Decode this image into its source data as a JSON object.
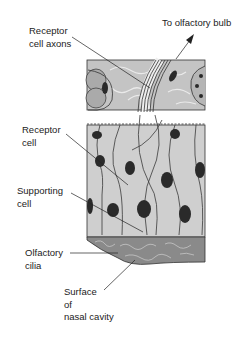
{
  "labels": {
    "receptor_axons": {
      "line1": "Receptor",
      "line2": "cell axons"
    },
    "olfactory_bulb": {
      "text": "To olfactory bulb"
    },
    "receptor_cell": {
      "line1": "Receptor",
      "line2": "cell"
    },
    "supporting_cell": {
      "line1": "Supporting",
      "line2": "cell"
    },
    "olfactory_cilia": {
      "line1": "Olfactory",
      "line2": "cilia"
    },
    "nasal_surface": {
      "line1": "Surface",
      "line2": "of",
      "line3": "nasal cavity"
    }
  },
  "colors": {
    "tissue": "#c9c9c9",
    "connective": "#bdbdbd",
    "nucleus": "#2a2a2a",
    "outline": "#3a3a3a",
    "cilia": "#6a6a6a"
  }
}
